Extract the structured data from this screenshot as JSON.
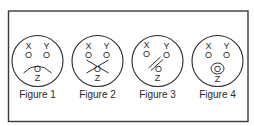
{
  "figures": [
    {
      "caption": "Figure 1",
      "labels": {
        "x": "X",
        "y": "Y",
        "z": "Z",
        "o": "O"
      },
      "mouth": "frown-arc"
    },
    {
      "caption": "Figure 2",
      "labels": {
        "x": "X",
        "y": "Y",
        "z": "Z",
        "o": "O"
      },
      "mouth": "crossed-lines"
    },
    {
      "caption": "Figure 3",
      "labels": {
        "x": "X",
        "y": "Y",
        "z": "Z",
        "o": "O"
      },
      "mouth": "double-slash"
    },
    {
      "caption": "Figure 4",
      "labels": {
        "x": "X",
        "y": "Y",
        "z": "Z",
        "o": "O"
      },
      "mouth": "ring-around-o"
    }
  ]
}
